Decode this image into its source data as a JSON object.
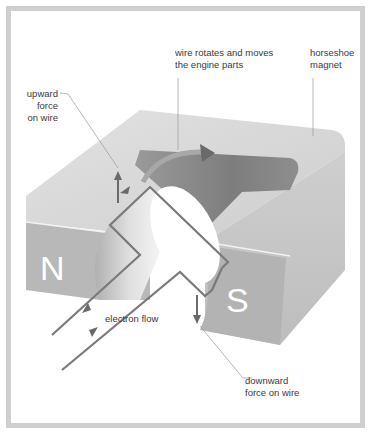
{
  "diagram": {
    "poles": {
      "north": "N",
      "south": "S"
    },
    "labels": {
      "rotation": "wire rotates and moves\nthe engine parts",
      "magnet": "horseshoe\nmagnet",
      "upward_force": "upward\nforce\non wire",
      "electron_flow": "electron flow",
      "downward_force": "downward\nforce on wire"
    },
    "colors": {
      "frame": "#cfcfcf",
      "magnet_top": "#d8d8d8",
      "magnet_front": "#b5b5b5",
      "magnet_side": "#c6c6c6",
      "magnet_inner": "#8a8a8a",
      "wire": "#7a7a7a",
      "text": "#3a3a3a",
      "leader": "#9a9a9a"
    }
  }
}
